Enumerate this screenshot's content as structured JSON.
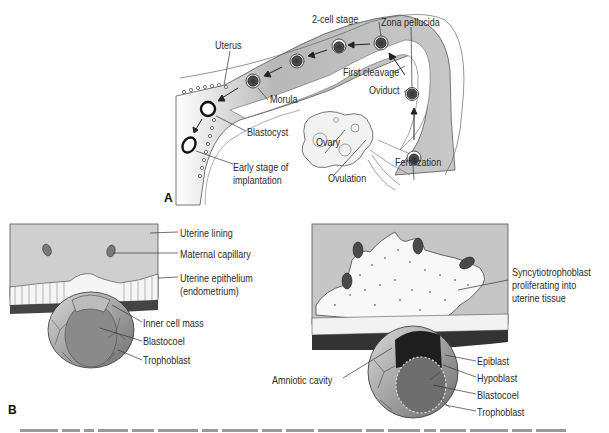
{
  "figure": {
    "panel_a": {
      "label": "A",
      "structures": {
        "uterus": "Uterus",
        "two_cell_stage": "2-cell stage",
        "zona_pellucida": "Zona pellucida",
        "first_cleavage": "First cleavage",
        "oviduct": "Oviduct",
        "morula": "Morula",
        "blastocyst": "Blastocyst",
        "early_implantation_line1": "Early stage of",
        "early_implantation_line2": "implantation",
        "ovary": "Ovary",
        "ovulation": "Ovulation",
        "fertilization": "Fertilization"
      }
    },
    "panel_b": {
      "label": "B",
      "left": {
        "uterine_lining": "Uterine lining",
        "maternal_capillary": "Maternal capillary",
        "uterine_epithelium_line1": "Uterine epithelium",
        "uterine_epithelium_line2": "(endometrium)",
        "inner_cell_mass": "Inner cell mass",
        "blastocoel": "Blastocoel",
        "trophoblast": "Trophoblast"
      },
      "right": {
        "syncytiotrophoblast_line1": "Syncytiotrophoblast",
        "syncytiotrophoblast_line2": "proliferating into",
        "syncytiotrophoblast_line3": "uterine tissue",
        "amniotic_cavity": "Amniotic cavity",
        "epiblast": "Epiblast",
        "hypoblast": "Hypoblast",
        "blastocoel": "Blastocoel",
        "trophoblast": "Trophoblast"
      }
    },
    "colors": {
      "tissue_gray": "#c9c9c9",
      "dark_tissue": "#3a3a3a",
      "cell_fill": "#f4f4f4",
      "label_text": "#2b2b2b"
    }
  }
}
